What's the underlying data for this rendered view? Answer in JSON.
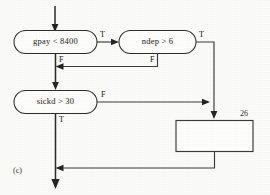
{
  "figure": {
    "caption": "(c)",
    "type": "flowchart"
  },
  "nodes": {
    "decision1": {
      "label": "gpay  <  8400",
      "shape": "rounded-decision"
    },
    "decision2": {
      "label": "ndep  >  6",
      "shape": "rounded-decision"
    },
    "decision3": {
      "label": "sickd  >  30",
      "shape": "rounded-decision"
    },
    "process1": {
      "label": "",
      "shape": "rectangle",
      "number": "26"
    }
  },
  "edge_labels": {
    "d1_true": "T",
    "d1_false": "F",
    "d2_true": "T",
    "d2_false": "F",
    "d3_true": "T",
    "d3_false": "F"
  },
  "colors": {
    "ink": "#2e2e2e",
    "paper": "#fbfbfa",
    "text": "#1b1b1b"
  }
}
